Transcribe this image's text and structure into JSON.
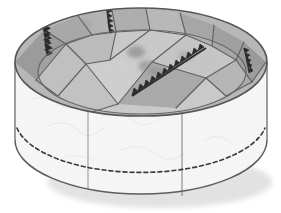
{
  "illustration": {
    "title": "Circular drum structure with paved top surface",
    "subject": "round platform / cylindrical drum, oblique view",
    "style": "grayscale line-and-tone drawing",
    "background_color": "#ffffff",
    "outline_color": "#55565a",
    "shadow_color": "#dcdcdc"
  },
  "geometry": {
    "top_ellipse": {
      "center_x": 141,
      "center_y": 62,
      "radius_x": 126,
      "radius_y": 54
    },
    "bottom_ellipse": {
      "center_x": 141,
      "center_y": 140,
      "radius_x": 126,
      "radius_y": 54
    },
    "inner_rim_ellipse": {
      "center_x": 142,
      "center_y": 72,
      "radius_x": 104,
      "radius_y": 42
    },
    "dashed_base_ellipse": {
      "center_x": 141,
      "center_y": 128,
      "radius_x": 126,
      "radius_y": 54
    },
    "wall_height": 78,
    "left_edge_x": 15,
    "right_edge_x": 267,
    "top_edge_y": 8,
    "bottom_edge_y": 196
  },
  "top_surface": {
    "label": "paved top with irregular polygonal slabs",
    "fill_base": "#c9c9c9",
    "slab_edge_color": "#5e6064",
    "slabs": [
      {
        "name": "outer-ring-slab-1",
        "tone": "#9e9e9e",
        "points": "15,62 44,30 66,44 36,80"
      },
      {
        "name": "outer-ring-slab-2",
        "tone": "#b4b4b4",
        "points": "44,30 78,16 92,35 66,44"
      },
      {
        "name": "outer-ring-slab-3",
        "tone": "#c6c6c6",
        "points": "78,16 112,10 116,32 92,35"
      },
      {
        "name": "outer-ring-slab-4",
        "tone": "#bdbdbd",
        "points": "112,10 146,9 150,30 116,32"
      },
      {
        "name": "outer-ring-slab-5",
        "tone": "#cfcfcf",
        "points": "146,9 180,13 186,35 150,30"
      },
      {
        "name": "outer-ring-slab-6",
        "tone": "#b0b0b0",
        "points": "180,13 214,25 212,46 186,35"
      },
      {
        "name": "outer-ring-slab-7",
        "tone": "#a6a6a6",
        "points": "214,25 244,42 236,60 212,46"
      },
      {
        "name": "outer-ring-slab-8",
        "tone": "#9a9a9a",
        "points": "244,42 266,62 252,82 236,60"
      },
      {
        "name": "outer-ring-slab-9",
        "tone": "#a2a2a2",
        "points": "266,62 252,82 226,96 240,74"
      },
      {
        "name": "inner-slab-a",
        "tone": "#c2c2c2",
        "points": "36,80 66,44 92,35 86,64 58,96"
      },
      {
        "name": "inner-slab-b",
        "tone": "#bcbcbc",
        "points": "66,44 92,35 116,32 110,60 86,64"
      },
      {
        "name": "inner-slab-c",
        "tone": "#d2d2d2",
        "points": "86,64 110,60 150,30 152,62 118,104"
      },
      {
        "name": "inner-slab-d",
        "tone": "#cccccc",
        "points": "116,32 150,30 186,35 152,62"
      },
      {
        "name": "inner-slab-e",
        "tone": "#c8c8c8",
        "points": "152,62 186,35 212,46 236,60 206,78"
      },
      {
        "name": "inner-slab-f",
        "tone": "#a8a8a8",
        "points": "118,104 152,62 206,78 176,108"
      },
      {
        "name": "inner-slab-g",
        "tone": "#b6b6b6",
        "points": "206,78 236,60 252,82 226,96"
      },
      {
        "name": "inner-slab-h",
        "tone": "#c4c4c4",
        "points": "58,96 86,64 118,104 92,112"
      }
    ],
    "stains": [
      {
        "name": "stain-center-1",
        "cx": 136,
        "cy": 52,
        "rx": 9,
        "ry": 6,
        "tone": "#9d9d9d"
      },
      {
        "name": "stain-center-2",
        "cx": 146,
        "cy": 66,
        "rx": 8,
        "ry": 6,
        "tone": "#a5a5a5"
      },
      {
        "name": "stain-center-3",
        "cx": 156,
        "cy": 72,
        "rx": 7,
        "ry": 5,
        "tone": "#9a9a9a"
      },
      {
        "name": "stain-upper-left",
        "cx": 85,
        "cy": 24,
        "rx": 7,
        "ry": 5,
        "tone": "#a8a8a8"
      },
      {
        "name": "stain-right",
        "cx": 186,
        "cy": 56,
        "rx": 8,
        "ry": 5,
        "tone": "#b0b0b0"
      }
    ]
  },
  "sawtooth_edges": {
    "label": "zigzag / sawtooth decorated joint lines",
    "color": "#2b2b2d",
    "tooth_size": 4,
    "segments": [
      {
        "name": "sawtooth-edge-left",
        "x1": 44,
        "y1": 22,
        "x2": 58,
        "y2": 52
      },
      {
        "name": "sawtooth-edge-upper-left",
        "x1": 108,
        "y1": 8,
        "x2": 118,
        "y2": 33
      },
      {
        "name": "sawtooth-edge-diagonal-main",
        "x1": 206,
        "y1": 48,
        "x2": 132,
        "y2": 96
      },
      {
        "name": "sawtooth-edge-right",
        "x1": 244,
        "y1": 48,
        "x2": 252,
        "y2": 72
      }
    ]
  },
  "wall": {
    "label": "textured cylindrical side wall",
    "fill": "#fbfbfb",
    "texture_color": "#dfdfdf",
    "seams": [
      {
        "name": "wall-seam-left",
        "x": 88,
        "y_top": 109,
        "y_bottom": 190
      },
      {
        "name": "wall-seam-right",
        "x": 182,
        "y_top": 113,
        "y_bottom": 196
      }
    ],
    "dashed_base_line": {
      "name": "hidden-base-line",
      "color": "#3a3a3c",
      "dash": "4 3"
    }
  }
}
